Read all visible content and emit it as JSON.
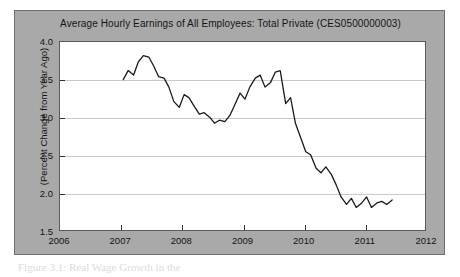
{
  "figure": {
    "caption": "Figure 3.1: Real Wage Growth in the",
    "panel_bg_color": "#a9a9a9",
    "plot_bg_color": "#ffffff",
    "line_color": "#1a1a1a",
    "grid_color": "#c9c9c9"
  },
  "chart_data": {
    "type": "line",
    "title": "Average Hourly Earnings of All Employees: Total Private (CES0500000003)",
    "xlabel": "",
    "ylabel": "(Percent Change from Year Ago)",
    "xlim": [
      2006,
      2012
    ],
    "ylim": [
      1.5,
      4.0
    ],
    "xticks": [
      "2006",
      "2007",
      "2008",
      "2009",
      "2010",
      "2011",
      "2012"
    ],
    "xtick_values": [
      2006,
      2007,
      2008,
      2009,
      2010,
      2011,
      2012
    ],
    "yticks": [
      "1.5",
      "2.0",
      "2.5",
      "3.0",
      "3.5",
      "4.0"
    ],
    "ytick_values": [
      1.5,
      2.0,
      2.5,
      3.0,
      3.5,
      4.0
    ],
    "grid": true,
    "grid_axis": "y",
    "legend": "none",
    "series": [
      {
        "name": "Average Hourly Earnings: Total Private (Percent Change from Year Ago)",
        "x": [
          2007.04,
          2007.12,
          2007.21,
          2007.29,
          2007.37,
          2007.46,
          2007.54,
          2007.62,
          2007.71,
          2007.79,
          2007.87,
          2007.96,
          2008.04,
          2008.12,
          2008.21,
          2008.29,
          2008.37,
          2008.46,
          2008.54,
          2008.62,
          2008.71,
          2008.79,
          2008.87,
          2008.96,
          2009.04,
          2009.12,
          2009.21,
          2009.29,
          2009.37,
          2009.46,
          2009.54,
          2009.62,
          2009.71,
          2009.79,
          2009.87,
          2009.96,
          2010.04,
          2010.12,
          2010.21,
          2010.29,
          2010.37,
          2010.46,
          2010.54,
          2010.62,
          2010.71,
          2010.79,
          2010.87,
          2010.96,
          2011.04,
          2011.12,
          2011.21,
          2011.29,
          2011.37,
          2011.46
        ],
        "y": [
          3.5,
          3.62,
          3.56,
          3.74,
          3.82,
          3.8,
          3.68,
          3.54,
          3.52,
          3.4,
          3.21,
          3.13,
          3.3,
          3.26,
          3.14,
          3.04,
          3.06,
          3.0,
          2.92,
          2.96,
          2.94,
          3.02,
          3.16,
          3.32,
          3.24,
          3.4,
          3.52,
          3.56,
          3.4,
          3.46,
          3.6,
          3.62,
          3.18,
          3.26,
          2.92,
          2.72,
          2.54,
          2.5,
          2.32,
          2.26,
          2.34,
          2.24,
          2.1,
          1.94,
          1.84,
          1.92,
          1.8,
          1.86,
          1.94,
          1.8,
          1.86,
          1.88,
          1.84,
          1.9
        ]
      }
    ]
  }
}
